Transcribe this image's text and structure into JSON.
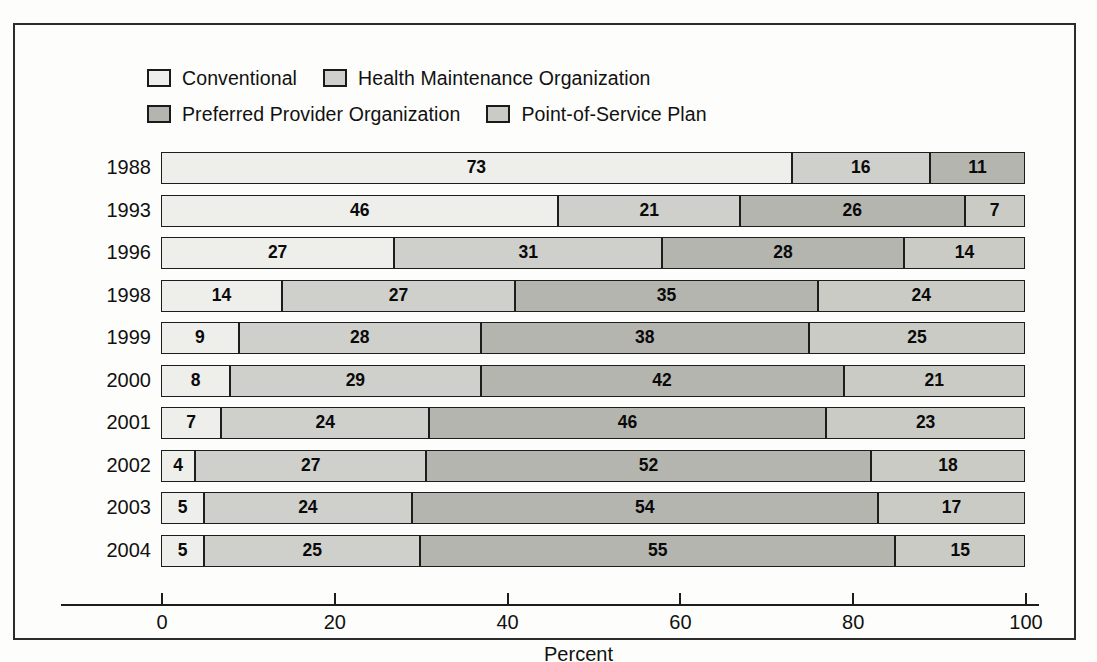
{
  "chart_data": {
    "type": "bar",
    "subtype": "stacked-horizontal-100",
    "title": "",
    "xlabel": "Percent",
    "ylabel": "",
    "xlim": [
      0,
      100
    ],
    "grid": false,
    "legend_position": "top",
    "categories": [
      "1988",
      "1993",
      "1996",
      "1998",
      "1999",
      "2000",
      "2001",
      "2002",
      "2003",
      "2004"
    ],
    "series": [
      {
        "name": "Conventional",
        "color": "#eeeeea",
        "values": [
          73,
          46,
          27,
          14,
          9,
          8,
          7,
          4,
          5,
          5
        ]
      },
      {
        "name": "Health Maintenance Organization",
        "color": "#cfcfcb",
        "values": [
          16,
          21,
          31,
          27,
          28,
          29,
          24,
          27,
          24,
          25
        ]
      },
      {
        "name": "Preferred Provider Organization",
        "color": "#b5b5b0",
        "values": [
          11,
          26,
          28,
          35,
          38,
          42,
          46,
          52,
          54,
          55
        ]
      },
      {
        "name": "Point-of-Service Plan",
        "color": "#cbcbc6",
        "values": [
          0,
          7,
          14,
          24,
          25,
          21,
          23,
          18,
          17,
          15
        ]
      }
    ],
    "xticks": [
      0,
      20,
      40,
      60,
      80,
      100
    ],
    "xtick_labels": [
      "0",
      "20",
      "40",
      "60",
      "80",
      "100"
    ]
  },
  "legend": {
    "rows": [
      [
        {
          "label": "Conventional",
          "swatch": "#eeeeea",
          "icon": "legend-swatch-icon"
        },
        {
          "label": "Health Maintenance Organization",
          "swatch": "#cfcfcb",
          "icon": "legend-swatch-icon"
        }
      ],
      [
        {
          "label": "Preferred Provider Organization",
          "swatch": "#b5b5b0",
          "icon": "legend-swatch-icon"
        },
        {
          "label": "Point-of-Service Plan",
          "swatch": "#cbcbc6",
          "icon": "legend-swatch-icon"
        }
      ]
    ]
  },
  "axis": {
    "title": "Percent",
    "ticks": [
      {
        "label": "0",
        "value": 0
      },
      {
        "label": "20",
        "value": 20
      },
      {
        "label": "40",
        "value": 40
      },
      {
        "label": "60",
        "value": 60
      },
      {
        "label": "80",
        "value": 80
      },
      {
        "label": "100",
        "value": 100
      }
    ]
  },
  "rows": [
    {
      "year": "1988",
      "segments": [
        {
          "series": "Conventional",
          "value": 73,
          "label": "73",
          "color": "#eeeeea"
        },
        {
          "series": "Health Maintenance Organization",
          "value": 16,
          "label": "16",
          "color": "#cfcfcb"
        },
        {
          "series": "Preferred Provider Organization",
          "value": 11,
          "label": "11",
          "color": "#b5b5b0"
        }
      ]
    },
    {
      "year": "1993",
      "segments": [
        {
          "series": "Conventional",
          "value": 46,
          "label": "46",
          "color": "#eeeeea"
        },
        {
          "series": "Health Maintenance Organization",
          "value": 21,
          "label": "21",
          "color": "#cfcfcb"
        },
        {
          "series": "Preferred Provider Organization",
          "value": 26,
          "label": "26",
          "color": "#b5b5b0"
        },
        {
          "series": "Point-of-Service Plan",
          "value": 7,
          "label": "7",
          "color": "#cbcbc6"
        }
      ]
    },
    {
      "year": "1996",
      "segments": [
        {
          "series": "Conventional",
          "value": 27,
          "label": "27",
          "color": "#eeeeea"
        },
        {
          "series": "Health Maintenance Organization",
          "value": 31,
          "label": "31",
          "color": "#cfcfcb"
        },
        {
          "series": "Preferred Provider Organization",
          "value": 28,
          "label": "28",
          "color": "#b5b5b0"
        },
        {
          "series": "Point-of-Service Plan",
          "value": 14,
          "label": "14",
          "color": "#cbcbc6"
        }
      ]
    },
    {
      "year": "1998",
      "segments": [
        {
          "series": "Conventional",
          "value": 14,
          "label": "14",
          "color": "#eeeeea"
        },
        {
          "series": "Health Maintenance Organization",
          "value": 27,
          "label": "27",
          "color": "#cfcfcb"
        },
        {
          "series": "Preferred Provider Organization",
          "value": 35,
          "label": "35",
          "color": "#b5b5b0"
        },
        {
          "series": "Point-of-Service Plan",
          "value": 24,
          "label": "24",
          "color": "#cbcbc6"
        }
      ]
    },
    {
      "year": "1999",
      "segments": [
        {
          "series": "Conventional",
          "value": 9,
          "label": "9",
          "color": "#eeeeea"
        },
        {
          "series": "Health Maintenance Organization",
          "value": 28,
          "label": "28",
          "color": "#cfcfcb"
        },
        {
          "series": "Preferred Provider Organization",
          "value": 38,
          "label": "38",
          "color": "#b5b5b0"
        },
        {
          "series": "Point-of-Service Plan",
          "value": 25,
          "label": "25",
          "color": "#cbcbc6"
        }
      ]
    },
    {
      "year": "2000",
      "segments": [
        {
          "series": "Conventional",
          "value": 8,
          "label": "8",
          "color": "#eeeeea"
        },
        {
          "series": "Health Maintenance Organization",
          "value": 29,
          "label": "29",
          "color": "#cfcfcb"
        },
        {
          "series": "Preferred Provider Organization",
          "value": 42,
          "label": "42",
          "color": "#b5b5b0"
        },
        {
          "series": "Point-of-Service Plan",
          "value": 21,
          "label": "21",
          "color": "#cbcbc6"
        }
      ]
    },
    {
      "year": "2001",
      "segments": [
        {
          "series": "Conventional",
          "value": 7,
          "label": "7",
          "color": "#eeeeea"
        },
        {
          "series": "Health Maintenance Organization",
          "value": 24,
          "label": "24",
          "color": "#cfcfcb"
        },
        {
          "series": "Preferred Provider Organization",
          "value": 46,
          "label": "46",
          "color": "#b5b5b0"
        },
        {
          "series": "Point-of-Service Plan",
          "value": 23,
          "label": "23",
          "color": "#cbcbc6"
        }
      ]
    },
    {
      "year": "2002",
      "segments": [
        {
          "series": "Conventional",
          "value": 4,
          "label": "4",
          "color": "#eeeeea"
        },
        {
          "series": "Health Maintenance Organization",
          "value": 27,
          "label": "27",
          "color": "#cfcfcb"
        },
        {
          "series": "Preferred Provider Organization",
          "value": 52,
          "label": "52",
          "color": "#b5b5b0"
        },
        {
          "series": "Point-of-Service Plan",
          "value": 18,
          "label": "18",
          "color": "#cbcbc6"
        }
      ]
    },
    {
      "year": "2003",
      "segments": [
        {
          "series": "Conventional",
          "value": 5,
          "label": "5",
          "color": "#eeeeea"
        },
        {
          "series": "Health Maintenance Organization",
          "value": 24,
          "label": "24",
          "color": "#cfcfcb"
        },
        {
          "series": "Preferred Provider Organization",
          "value": 54,
          "label": "54",
          "color": "#b5b5b0"
        },
        {
          "series": "Point-of-Service Plan",
          "value": 17,
          "label": "17",
          "color": "#cbcbc6"
        }
      ]
    },
    {
      "year": "2004",
      "segments": [
        {
          "series": "Conventional",
          "value": 5,
          "label": "5",
          "color": "#eeeeea"
        },
        {
          "series": "Health Maintenance Organization",
          "value": 25,
          "label": "25",
          "color": "#cfcfcb"
        },
        {
          "series": "Preferred Provider Organization",
          "value": 55,
          "label": "55",
          "color": "#b5b5b0"
        },
        {
          "series": "Point-of-Service Plan",
          "value": 15,
          "label": "15",
          "color": "#cbcbc6"
        }
      ]
    }
  ]
}
